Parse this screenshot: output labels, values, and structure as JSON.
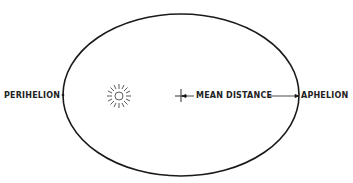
{
  "diagram": {
    "labels": {
      "perihelion": "PERIHELION",
      "aphelion": "APHELION",
      "mean_distance": "MEAN DISTANCE"
    },
    "icons": {
      "sun": "sun-icon",
      "center": "center-cross-icon"
    },
    "colors": {
      "line": "#1a1a1a",
      "background": "#ffffff"
    }
  }
}
